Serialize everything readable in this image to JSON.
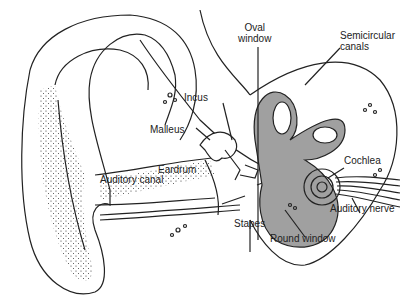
{
  "colors": {
    "line": "#222222",
    "inner_ear_fill": "#a0a0a0",
    "background": "#ffffff"
  },
  "labels": {
    "oval_window_1": "Oval",
    "oval_window_2": "window",
    "semicircular_1": "Semicircular",
    "semicircular_2": "canals",
    "incus": "Incus",
    "malleus": "Malleus",
    "cochlea": "Cochlea",
    "eardrum": "Eardrum",
    "auditory_canal": "Auditory canal",
    "stapes": "Stapes",
    "auditory_nerve": "Auditory nerve",
    "round_window": "Round window"
  }
}
